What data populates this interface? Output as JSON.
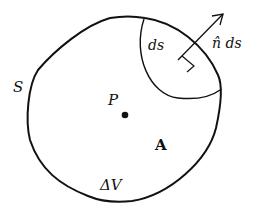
{
  "diagram": {
    "labels": {
      "surface": "S",
      "point": "P",
      "vector_field": "A",
      "volume": "ΔV",
      "surface_element": "ds",
      "normal_element": "n̂ ds"
    },
    "colors": {
      "stroke": "#111111",
      "background": "#ffffff"
    }
  }
}
